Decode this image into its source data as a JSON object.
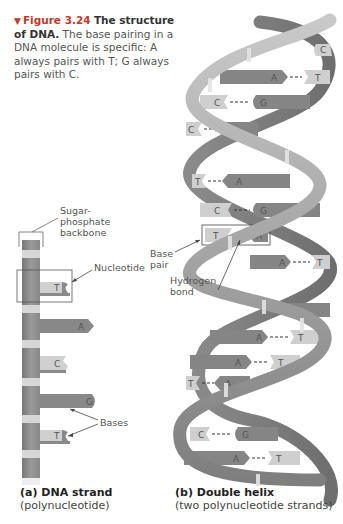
{
  "caption": {
    "figure_marker": "▼",
    "figure_number": "Figure 3.24",
    "title": "The structure of DNA.",
    "text": "The base pairing in a DNA molecule is specific: A always pairs with T; G always pairs with C."
  },
  "panel_a": {
    "labels": {
      "backbone": "Sugar-phosphate backbone",
      "nucleotide": "Nucleotide",
      "bases": "Bases"
    },
    "strand_bases": [
      "T",
      "A",
      "C",
      "G",
      "T"
    ],
    "title_bold": "(a) DNA strand",
    "title_sub": "(polynucleotide)"
  },
  "panel_b": {
    "labels": {
      "base_pair": "Base pair",
      "hydrogen_bond": "Hydrogen bond"
    },
    "base_pairs": [
      {
        "left": "",
        "right": "C"
      },
      {
        "left": "A",
        "right": "T"
      },
      {
        "left": "C",
        "right": "G"
      },
      {
        "left": "C",
        "right": "G"
      },
      {
        "left": "T",
        "right": "A"
      },
      {
        "left": "C",
        "right": "G"
      },
      {
        "left": "T",
        "right": "A"
      },
      {
        "left": "A",
        "right": "T"
      },
      {
        "left": "",
        "right": "G"
      },
      {
        "left": "A",
        "right": "T"
      },
      {
        "left": "A",
        "right": "T"
      },
      {
        "left": "T",
        "right": "A"
      },
      {
        "left": "C",
        "right": "G"
      },
      {
        "left": "A",
        "right": "T"
      }
    ],
    "title_bold": "(b) Double helix",
    "title_sub": "(two polynucleotide strands)"
  },
  "colors": {
    "figure_label": "#c0392b",
    "backbone": "#8e8e8e",
    "backbone_light": "#cfcfcf",
    "purine": "#8a8a8a",
    "pyrimidine": "#c8c8c8",
    "ribbon": "#a9a9a9",
    "ribbon_dark": "#7a7a7a"
  }
}
